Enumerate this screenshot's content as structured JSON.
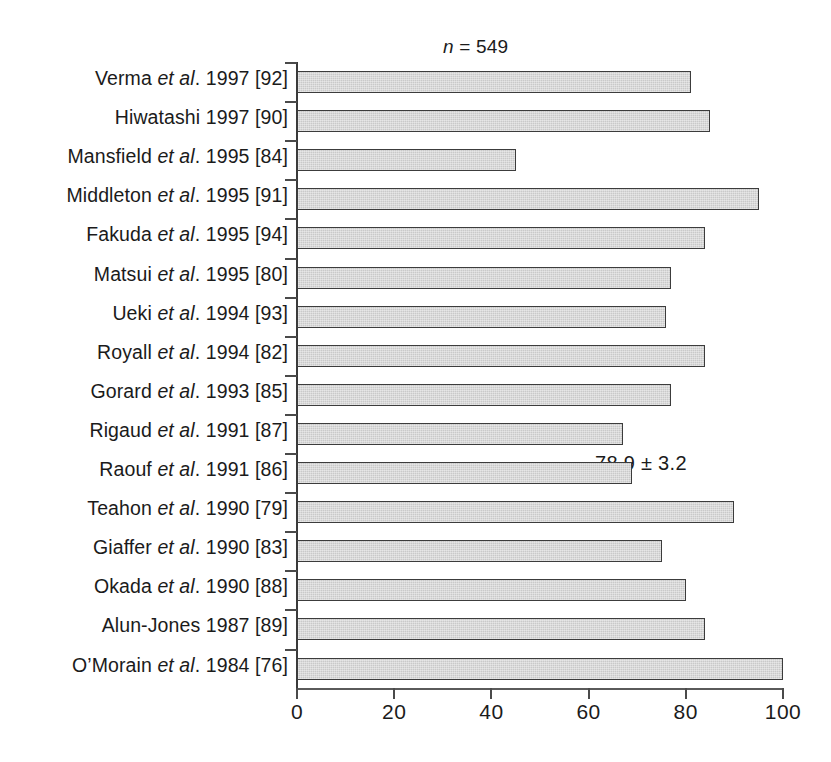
{
  "chart_data": {
    "type": "bar",
    "orientation": "horizontal",
    "title": "",
    "xlabel": "",
    "ylabel": "",
    "xlim": [
      0,
      100
    ],
    "xticks": [
      0,
      20,
      40,
      60,
      80,
      100
    ],
    "xtick_labels": [
      "0",
      "20",
      "40",
      "60",
      "80",
      "100"
    ],
    "grid": false,
    "legend": null,
    "annotations": [
      {
        "id": "sample-size",
        "text_parts": {
          "symbol": "n",
          "rest": " = 549"
        },
        "text": "n = 549"
      },
      {
        "id": "mean-value",
        "text": "78.9 ± 3.2"
      }
    ],
    "categories": [
      "Verma et al. 1997 [92]",
      "Hiwatashi 1997 [90]",
      "Mansfield et al. 1995 [84]",
      "Middleton et al. 1995 [91]",
      "Fakuda et al. 1995 [94]",
      "Matsui et al. 1995 [80]",
      "Ueki et al. 1994 [93]",
      "Royall et al. 1994 [82]",
      "Gorard et al. 1993 [85]",
      "Rigaud et al. 1991 [87]",
      "Raouf et al. 1991 [86]",
      "Teahon et al. 1990 [79]",
      "Giaffer et al. 1990 [83]",
      "Okada et al. 1990 [88]",
      "Alun-Jones 1987 [89]",
      "O’Morain et al. 1984 [76]"
    ],
    "values": [
      81,
      85,
      45,
      95,
      84,
      77,
      76,
      84,
      77,
      67,
      69,
      90,
      75,
      80,
      84,
      100
    ]
  },
  "rows": [
    {
      "author": "Verma ",
      "italic": "et al",
      "tail": ". 1997 [92]",
      "value": 81
    },
    {
      "author": "Hiwatashi 1997 [90]",
      "italic": "",
      "tail": "",
      "value": 85
    },
    {
      "author": "Mansfield ",
      "italic": "et al",
      "tail": ". 1995 [84]",
      "value": 45
    },
    {
      "author": "Middleton ",
      "italic": "et al",
      "tail": ". 1995 [91]",
      "value": 95
    },
    {
      "author": "Fakuda ",
      "italic": "et al",
      "tail": ". 1995 [94]",
      "value": 84
    },
    {
      "author": "Matsui ",
      "italic": "et al",
      "tail": ". 1995 [80]",
      "value": 77
    },
    {
      "author": "Ueki ",
      "italic": "et al",
      "tail": ". 1994 [93]",
      "value": 76
    },
    {
      "author": "Royall ",
      "italic": "et al",
      "tail": ". 1994 [82]",
      "value": 84
    },
    {
      "author": "Gorard ",
      "italic": "et al",
      "tail": ". 1993 [85]",
      "value": 77
    },
    {
      "author": "Rigaud ",
      "italic": "et al",
      "tail": ". 1991 [87]",
      "value": 67
    },
    {
      "author": "Raouf ",
      "italic": "et al",
      "tail": ". 1991 [86]",
      "value": 69
    },
    {
      "author": "Teahon ",
      "italic": "et al",
      "tail": ". 1990 [79]",
      "value": 90
    },
    {
      "author": "Giaffer ",
      "italic": "et al",
      "tail": ". 1990 [83]",
      "value": 75
    },
    {
      "author": "Okada ",
      "italic": "et al",
      "tail": ". 1990 [88]",
      "value": 80
    },
    {
      "author": "Alun-Jones 1987 [89]",
      "italic": "",
      "tail": "",
      "value": 84
    },
    {
      "author": "O’Morain ",
      "italic": "et al",
      "tail": ". 1984 [76]",
      "value": 100
    }
  ],
  "annotations": {
    "sample_size_symbol": "n",
    "sample_size_rest": " = 549",
    "mean": "78.9 ± 3.2"
  },
  "axis": {
    "tick_labels": [
      "0",
      "20",
      "40",
      "60",
      "80",
      "100"
    ]
  },
  "colors": {
    "bar_fill": "#c9c9c9",
    "bar_stroke": "#3c3c3c",
    "axis": "#4a4a4a",
    "text": "#1b1b1b",
    "background": "#ffffff"
  }
}
